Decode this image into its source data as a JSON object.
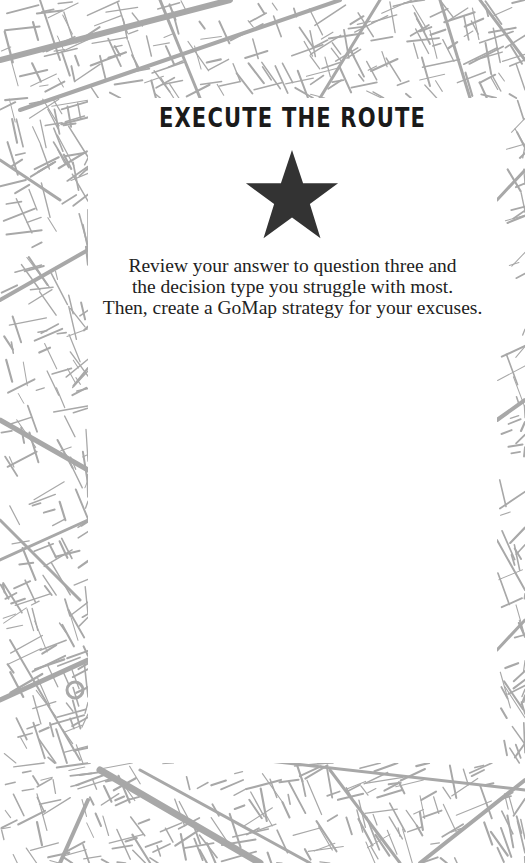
{
  "background": {
    "icon": "street-map-pattern",
    "line_color": "#a8a8a8"
  },
  "panel": {
    "title": "EXECUTE THE ROUTE",
    "icon": "star-icon",
    "icon_color": "#333333",
    "instructions": [
      "Review your answer to question three and",
      "the decision type you struggle with most.",
      "Then, create a GoMap strategy for your excuses."
    ]
  }
}
